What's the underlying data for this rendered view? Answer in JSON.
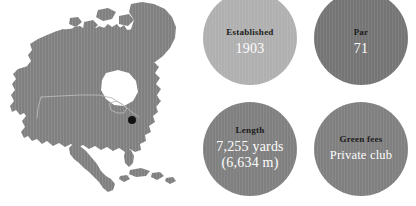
{
  "panel": {
    "background_color": "#ffffff",
    "width": 416,
    "height": 206
  },
  "map": {
    "region_name": "North America",
    "land_color": "#808080",
    "border_line_color": "#b9b9b9",
    "water_color": "#ffffff",
    "marker": {
      "icon": "location-dot-icon",
      "color": "#111111",
      "x": 132,
      "y": 120,
      "description": "Course location marker on the United States east coast"
    }
  },
  "stats": [
    {
      "id": "established",
      "label": "Established",
      "value": "1903",
      "value_lines": [
        "1903"
      ],
      "fill_color": "#b0b0b0",
      "label_color": "#1c1c1c",
      "value_color": "#fdfdfd"
    },
    {
      "id": "par",
      "label": "Par",
      "value": "71",
      "value_lines": [
        "71"
      ],
      "fill_color": "#757575",
      "label_color": "#1c1c1c",
      "value_color": "#fdfdfd"
    },
    {
      "id": "length",
      "label": "Length",
      "value": "7,255 yards (6,634 m)",
      "value_lines": [
        "7,255 yards",
        "(6,634 m)"
      ],
      "fill_color": "#808080",
      "label_color": "#1c1c1c",
      "value_color": "#fdfdfd"
    },
    {
      "id": "green-fees",
      "label": "Green fees",
      "value": "Private club",
      "value_lines": [
        "Private club"
      ],
      "fill_color": "#808080",
      "label_color": "#1c1c1c",
      "value_color": "#fdfdfd"
    }
  ]
}
